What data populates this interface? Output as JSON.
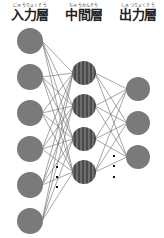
{
  "diagram": {
    "layers": [
      {
        "id": "input",
        "label": "入力層",
        "furigana": "にゅうりょくそう",
        "label_x": 30,
        "node_x": 30,
        "node_radius": 13,
        "node_ys": [
          41,
          77,
          113,
          149,
          185,
          221
        ],
        "fill": "#7a7a7a",
        "pattern": "solid"
      },
      {
        "id": "hidden",
        "label": "中間層",
        "furigana": "ちゅうかんそう",
        "label_x": 84,
        "node_x": 84,
        "node_radius": 12,
        "node_ys": [
          73,
          106,
          139,
          172
        ],
        "fill": "#555555",
        "pattern": "striped"
      },
      {
        "id": "output",
        "label": "出力層",
        "furigana": "しゅつりょくそう",
        "label_x": 138,
        "node_x": 138,
        "node_radius": 12,
        "node_ys": [
          89,
          123,
          157
        ],
        "fill": "#7a7a7a",
        "pattern": "solid"
      }
    ],
    "ellipsis": [
      {
        "x": 57,
        "ys": [
          167,
          177,
          187
        ]
      },
      {
        "x": 114,
        "ys": [
          156,
          166,
          177
        ]
      }
    ],
    "edge_color": "#6a6a6a"
  },
  "labels": {
    "input": {
      "main": "入力層",
      "furigana": "にゅうりょくそう"
    },
    "hidden": {
      "main": "中間層",
      "furigana": "ちゅうかんそう"
    },
    "output": {
      "main": "出力層",
      "furigana": "しゅつりょくそう"
    }
  }
}
